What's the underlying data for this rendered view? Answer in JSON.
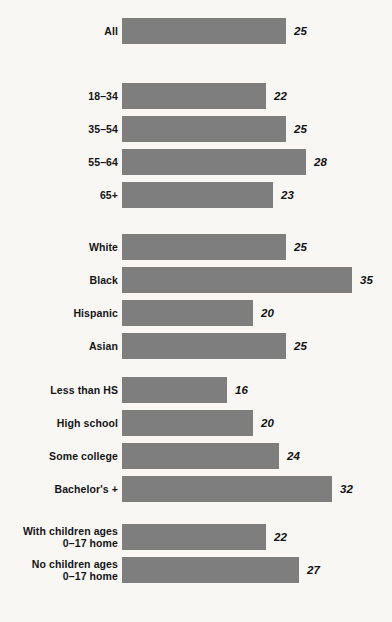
{
  "chart_data": {
    "type": "bar",
    "title": "",
    "subtitle": "",
    "xlabel": "",
    "ylabel": "",
    "orientation": "horizontal",
    "grid": false,
    "legend": null,
    "xlim": [
      0,
      35
    ],
    "bar_color": "#7e7e7e",
    "background_color": "#f8f7f4",
    "text_color": "#141414",
    "categories": [
      "All",
      "18–34",
      "35–54",
      "55–64",
      "65+",
      "White",
      "Black",
      "Hispanic",
      "Asian",
      "Less than HS",
      "High school",
      "Some college",
      "Bachelor's +",
      "With children ages\n0–17 home",
      "No children ages\n0–17 home"
    ],
    "values": [
      25,
      22,
      25,
      28,
      23,
      25,
      35,
      20,
      25,
      16,
      20,
      24,
      32,
      22,
      27
    ],
    "groups": [
      {
        "name": "Total",
        "rows": [
          0
        ]
      },
      {
        "name": "Age",
        "rows": [
          1,
          2,
          3,
          4
        ]
      },
      {
        "name": "Race and ethnicity",
        "rows": [
          5,
          6,
          7,
          8
        ]
      },
      {
        "name": "Education",
        "rows": [
          9,
          10,
          11,
          12
        ]
      },
      {
        "name": "Children in household",
        "rows": [
          13,
          14
        ]
      }
    ]
  },
  "rows": [
    {
      "label_lines": [
        "All"
      ],
      "value": "25",
      "value_num": 25,
      "top": 18
    },
    {
      "label_lines": [
        "18–34"
      ],
      "value": "22",
      "value_num": 22,
      "top": 83
    },
    {
      "label_lines": [
        "35–54"
      ],
      "value": "25",
      "value_num": 25,
      "top": 116
    },
    {
      "label_lines": [
        "55–64"
      ],
      "value": "28",
      "value_num": 28,
      "top": 149
    },
    {
      "label_lines": [
        "65+"
      ],
      "value": "23",
      "value_num": 23,
      "top": 182
    },
    {
      "label_lines": [
        "White"
      ],
      "value": "25",
      "value_num": 25,
      "top": 234
    },
    {
      "label_lines": [
        "Black"
      ],
      "value": "35",
      "value_num": 35,
      "top": 267
    },
    {
      "label_lines": [
        "Hispanic"
      ],
      "value": "20",
      "value_num": 20,
      "top": 300
    },
    {
      "label_lines": [
        "Asian"
      ],
      "value": "25",
      "value_num": 25,
      "top": 333
    },
    {
      "label_lines": [
        "Less than HS"
      ],
      "value": "16",
      "value_num": 16,
      "top": 377
    },
    {
      "label_lines": [
        "High school"
      ],
      "value": "20",
      "value_num": 20,
      "top": 410
    },
    {
      "label_lines": [
        "Some college"
      ],
      "value": "24",
      "value_num": 24,
      "top": 443
    },
    {
      "label_lines": [
        "Bachelor's +"
      ],
      "value": "32",
      "value_num": 32,
      "top": 476
    },
    {
      "label_lines": [
        "With children ages",
        "0–17 home"
      ],
      "value": "22",
      "value_num": 22,
      "top": 524
    },
    {
      "label_lines": [
        "No children ages",
        "0–17 home"
      ],
      "value": "27",
      "value_num": 27,
      "top": 557
    }
  ],
  "scale": {
    "px_per_unit": 6.56,
    "bar_left_px": 122,
    "value_gap_px": 8
  }
}
